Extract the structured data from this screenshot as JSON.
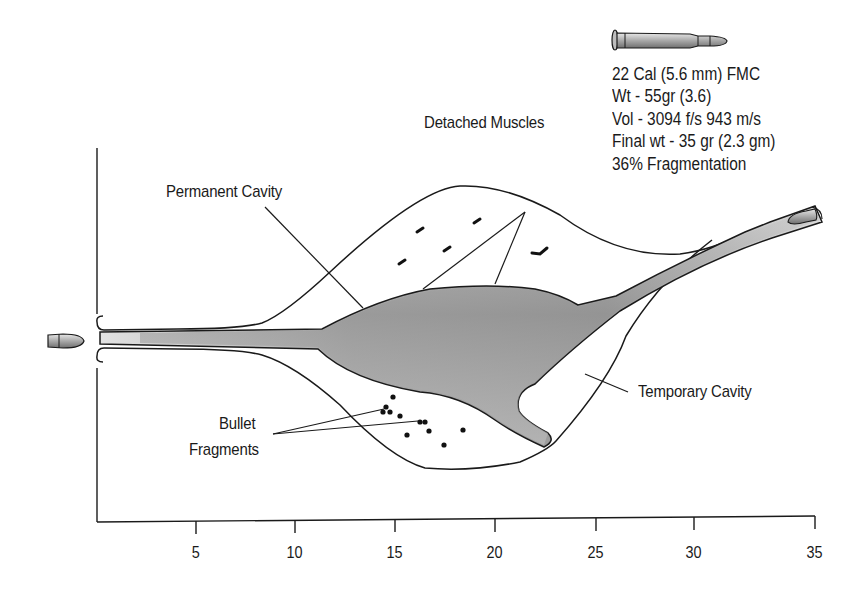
{
  "diagram": {
    "bullet_specs": {
      "caliber": "22 Cal (5.6 mm) FMC",
      "weight": "Wt - 55gr (3.6)",
      "velocity": "Vol - 3094 f/s 943 m/s",
      "final_weight": "Final wt - 35 gr (2.3 gm)",
      "fragmentation": "36% Fragmentation"
    },
    "labels": {
      "permanent_cavity": "Permanent Cavity",
      "detached_muscles": "Detached Muscles",
      "temporary_cavity": "Temporary Cavity",
      "bullet_fragments_line1": "Bullet",
      "bullet_fragments_line2": "Fragments"
    },
    "axis": {
      "x_ticks": [
        "5",
        "10",
        "15",
        "20",
        "25",
        "30",
        "35"
      ],
      "unit": ""
    },
    "colors": {
      "outline": "#1a1a1a",
      "cavity_fill_dark": "#8c8c8c",
      "cavity_fill_light": "#d8d8d8",
      "bullet_fill": "#b5b5b5"
    },
    "icons": {
      "cartridge": "cartridge-icon",
      "entry_bullet": "bullet-icon",
      "exit_bullet": "bullet-icon"
    }
  }
}
